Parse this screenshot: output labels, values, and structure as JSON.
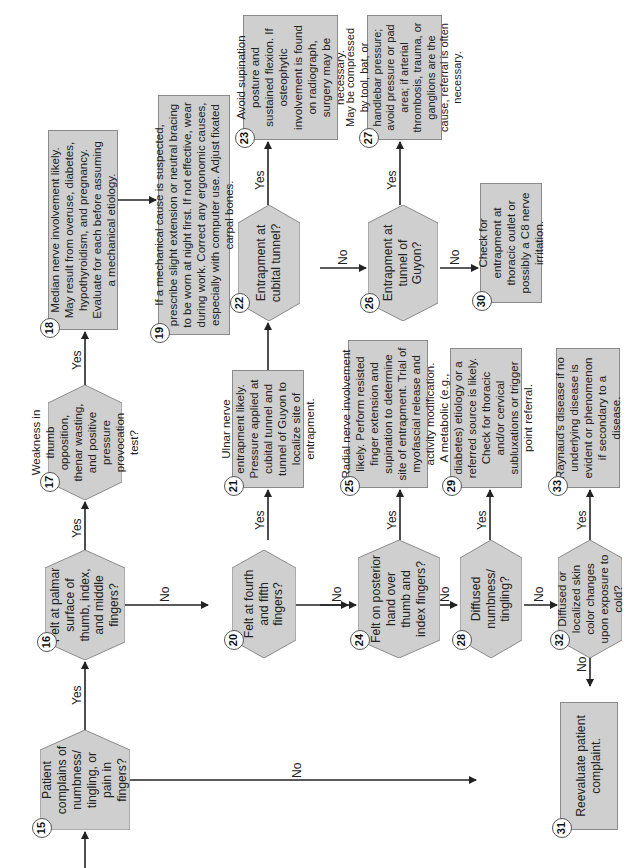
{
  "nodes": {
    "n15": {
      "num": "15",
      "text": "Patient complains of numbness/ tingling, or pain in fingers?"
    },
    "n16": {
      "num": "16",
      "text": "Felt at palmar surface of thumb, index, and middle fingers?"
    },
    "n17": {
      "num": "17",
      "text": "Weakness in thumb opposition, thenar wasting, and positive pressure provocation test?"
    },
    "n18": {
      "num": "18",
      "text": "Median nerve involvement likely. May result from overuse, diabetes, hypothyroidism, and pregnancy. Evaluate for each before assuming a mechanical etiology."
    },
    "n19": {
      "num": "19",
      "text": "If a mechanical cause is suspected, prescribe slight extension or neutral bracing to be worn at night first. If not effective, wear during work. Correct any ergonomic causes, especially with computer use. Adjust fixated carpal bones."
    },
    "n20": {
      "num": "20",
      "text": "Felt at fourth and fifth fingers?"
    },
    "n21": {
      "num": "21",
      "text": "Ulnar nerve entrapment likely. Pressure applied at cubital tunnel and tunnel of Guyon to localize site of entrapment."
    },
    "n22": {
      "num": "22",
      "text": "Entrapment at cubital tunnel?"
    },
    "n23": {
      "num": "23",
      "text": "Avoid supination posture and sustained flexion. If osteophytic involvement is found on radiograph, surgery may be necessary."
    },
    "n24": {
      "num": "24",
      "text": "Felt on posterior hand over thumb and index fingers?"
    },
    "n25": {
      "num": "25",
      "text": "Radial nerve involvement likely. Perform resisted finger extension and supination to determine site of entrapment. Trial of myofascial release and activity modification."
    },
    "n26": {
      "num": "26",
      "text": "Entrapment at tunnel of Guyon?"
    },
    "n27": {
      "num": "27",
      "text": "May be compressed by tool, bat, or handlebar pressure; avoid pressure or pad area; if arterial thrombosis, trauma, or ganglions are the cause, referral is often necessary."
    },
    "n28": {
      "num": "28",
      "text": "Diffused numbness/ tingling?"
    },
    "n29": {
      "num": "29",
      "text": "A metabolic (e.g., diabetes) etiology or a referred source is likely. Check for thoracic and/or cervical subluxations or trigger point referral."
    },
    "n30": {
      "num": "30",
      "text": "Check for entrapment at thoracic outlet or possibly a C8 nerve irritation."
    },
    "n31": {
      "num": "31",
      "text": "Reevaluate patient complaint."
    },
    "n32": {
      "num": "32",
      "text": "Diffused or localized skin color changes upon exposure to cold?"
    },
    "n33": {
      "num": "33",
      "text": "Raynaud's disease if no underlying disease is evident or phenomenon if secondary to a disease."
    }
  },
  "edge_labels": {
    "yes": "Yes",
    "no": "No"
  },
  "colors": {
    "fill": "#cfcfcf",
    "border": "#8a8a8a",
    "line": "#222222"
  }
}
